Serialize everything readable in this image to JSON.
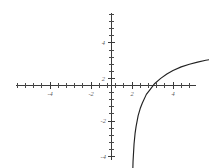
{
  "figure": {
    "background_color": "#ffffff",
    "axis_color": "#3a3a3a",
    "curve_color": "#222222",
    "label_color": "#5d5d5d"
  },
  "axes": {
    "x_label_neg4": "-4",
    "x_label_neg2": "-2",
    "x_label_pos2": "2",
    "x_label_pos4": "4",
    "y_label_pos4": "4",
    "y_label_pos2": "2",
    "y_label_neg2": "-2",
    "y_label_neg4": "-4"
  },
  "chart_data": {
    "type": "line",
    "title": "",
    "xlabel": "",
    "ylabel": "",
    "xlim": [
      -5.5,
      5.5
    ],
    "ylim": [
      -5.5,
      5.5
    ],
    "grid": false,
    "legend": null,
    "x_ticks_major": [
      -4,
      -2,
      2,
      4
    ],
    "y_ticks_major": [
      -4,
      -2,
      2,
      4
    ],
    "tick_minor_step": 0.5,
    "vertical_asymptote": 1.0,
    "x_intercept": 1.7,
    "series": [
      {
        "name": "logarithmic curve",
        "description": "increasing logarithmic curve with vertical asymptote at x = 1",
        "x": [
          1.02,
          1.05,
          1.1,
          1.15,
          1.2,
          1.3,
          1.4,
          1.5,
          1.7,
          1.9,
          2.1,
          2.4,
          2.7,
          3.0,
          3.4,
          3.8,
          4.2,
          4.6,
          5.0,
          5.3
        ],
        "y": [
          -5.6,
          -4.3,
          -3.3,
          -2.7,
          -2.3,
          -1.7,
          -1.3,
          -1.0,
          -0.5,
          -0.2,
          0.1,
          0.4,
          0.65,
          0.85,
          1.05,
          1.2,
          1.32,
          1.42,
          1.5,
          1.56
        ]
      }
    ]
  }
}
